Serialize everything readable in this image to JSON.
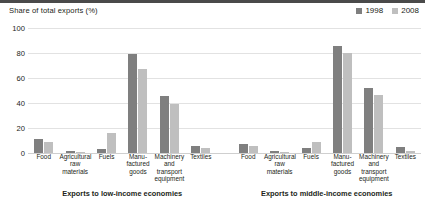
{
  "chart_data": {
    "type": "bar",
    "title": "",
    "ylabel": "Share of total exports (%)",
    "xlabel": "",
    "ylim": [
      0,
      100
    ],
    "yticks": [
      0,
      20,
      40,
      60,
      80,
      100
    ],
    "grid": true,
    "legend_position": "top-right",
    "legend": [
      "1998",
      "2008"
    ],
    "categories": [
      "Food",
      "Agricultural raw materials",
      "Fuels",
      "Manufactured goods",
      "Machinery and transport equipment",
      "Textiles"
    ],
    "groups": [
      {
        "name": "Exports to low-income economies",
        "series": [
          {
            "name": "1998",
            "values": [
              11,
              1.5,
              3,
              79,
              46,
              6
            ]
          },
          {
            "name": "2008",
            "values": [
              8.5,
              1.2,
              16,
              67,
              39.5,
              4
            ]
          }
        ]
      },
      {
        "name": "Exports to middle-income economies",
        "series": [
          {
            "name": "1998",
            "values": [
              7.5,
              1.5,
              4,
              86,
              52,
              5
            ]
          },
          {
            "name": "2008",
            "values": [
              5.5,
              1.2,
              8.5,
              80,
              46.5,
              1.5
            ]
          }
        ]
      }
    ]
  },
  "colors": {
    "series_1998": "#7f7f7f",
    "series_2008": "#bfbfbf",
    "gridline": "#e2e2e2",
    "text": "#231f20",
    "background": "#ffffff"
  },
  "axis": {
    "y_title": "Share of total exports (%)",
    "tick_labels": [
      "100",
      "80",
      "60",
      "40",
      "20",
      "0"
    ]
  },
  "legend": {
    "items": [
      {
        "label": "1998",
        "color": "#7f7f7f"
      },
      {
        "label": "2008",
        "color": "#bfbfbf"
      }
    ]
  },
  "category_labels": [
    [
      "Food"
    ],
    [
      "Agricultural",
      "raw",
      "materials"
    ],
    [
      "Fuels"
    ],
    [
      "Manu-",
      "factured",
      "goods"
    ],
    [
      "Machinery",
      "and",
      "transport",
      "equipment"
    ],
    [
      "Textiles"
    ]
  ],
  "group_titles": [
    "Exports to low-income economies",
    "Exports to middle-income economies"
  ]
}
